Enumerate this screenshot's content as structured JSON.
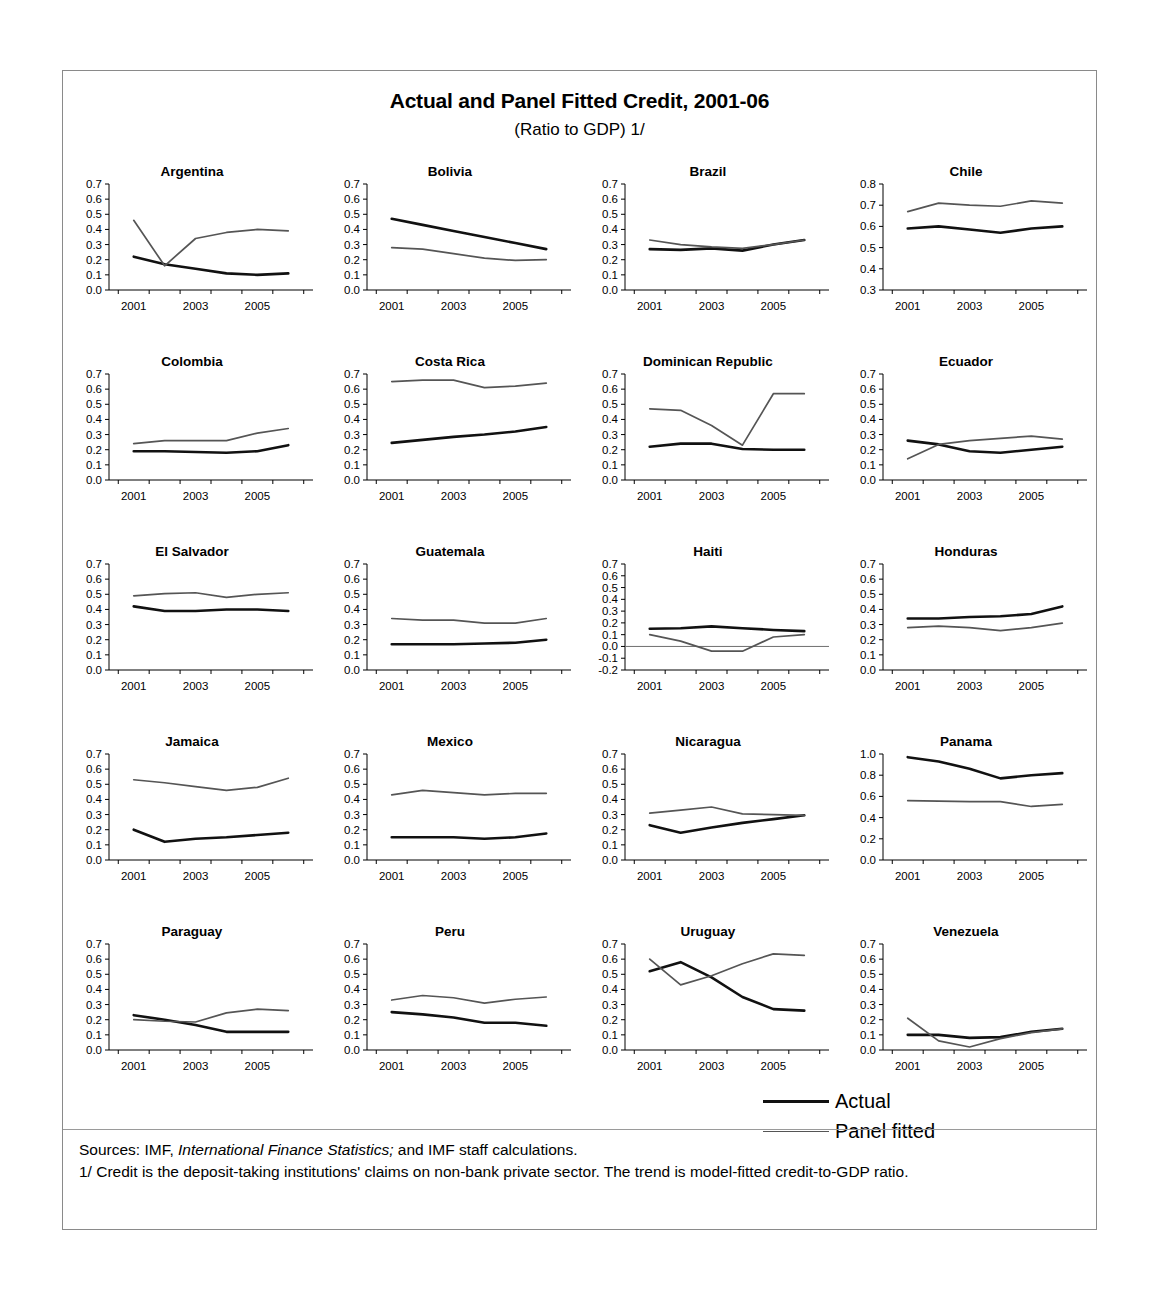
{
  "figure": {
    "title": "Actual and Panel Fitted Credit, 2001-06",
    "subtitle": "(Ratio to GDP) 1/",
    "legend": {
      "actual": "Actual",
      "fitted": "Panel fitted"
    },
    "notes": {
      "line1_a": "Sources: IMF, ",
      "line1_italic": "International Finance Statistics;",
      "line1_b": " and IMF staff calculations.",
      "line2": "1/ Credit is the deposit-taking institutions' claims on non-bank private sector. The trend is model-fitted credit-to-GDP ratio."
    }
  },
  "chart_data": {
    "type": "line",
    "title": "Actual and Panel Fitted Credit, 2001-06",
    "subtitle": "(Ratio to GDP) 1/",
    "xlabel": "",
    "ylabel": "Ratio to GDP",
    "x": [
      2001,
      2002,
      2003,
      2004,
      2005,
      2006
    ],
    "xtick_labels": [
      "2001",
      "2003",
      "2005"
    ],
    "grid": false,
    "legend_position": "bottom-right",
    "series_names": [
      "Actual",
      "Panel fitted"
    ],
    "panels": [
      {
        "name": "Argentina",
        "ylim": [
          0.0,
          0.7
        ],
        "yticks": [
          "0.0",
          "0.1",
          "0.2",
          "0.3",
          "0.4",
          "0.5",
          "0.6",
          "0.7"
        ],
        "series": [
          {
            "name": "Actual",
            "values": [
              0.22,
              0.17,
              0.14,
              0.11,
              0.1,
              0.11
            ]
          },
          {
            "name": "Panel fitted",
            "values": [
              0.46,
              0.16,
              0.34,
              0.38,
              0.4,
              0.39
            ]
          }
        ]
      },
      {
        "name": "Bolivia",
        "ylim": [
          0.0,
          0.7
        ],
        "yticks": [
          "0.0",
          "0.1",
          "0.2",
          "0.3",
          "0.4",
          "0.5",
          "0.6",
          "0.7"
        ],
        "series": [
          {
            "name": "Actual",
            "values": [
              0.47,
              0.43,
              0.39,
              0.35,
              0.31,
              0.27
            ]
          },
          {
            "name": "Panel fitted",
            "values": [
              0.28,
              0.27,
              0.24,
              0.21,
              0.195,
              0.2
            ]
          }
        ]
      },
      {
        "name": "Brazil",
        "ylim": [
          0.0,
          0.7
        ],
        "yticks": [
          "0.0",
          "0.1",
          "0.2",
          "0.3",
          "0.4",
          "0.5",
          "0.6",
          "0.7"
        ],
        "series": [
          {
            "name": "Actual",
            "values": [
              0.27,
              0.265,
              0.275,
              0.26,
              0.3,
              0.33
            ]
          },
          {
            "name": "Panel fitted",
            "values": [
              0.33,
              0.3,
              0.285,
              0.275,
              0.3,
              0.33
            ]
          }
        ]
      },
      {
        "name": "Chile",
        "ylim": [
          0.3,
          0.8
        ],
        "yticks": [
          "0.3",
          "0.4",
          "0.5",
          "0.6",
          "0.7",
          "0.8"
        ],
        "series": [
          {
            "name": "Actual",
            "values": [
              0.59,
              0.6,
              0.585,
              0.57,
              0.59,
              0.6
            ]
          },
          {
            "name": "Panel fitted",
            "values": [
              0.67,
              0.71,
              0.7,
              0.695,
              0.72,
              0.71
            ]
          }
        ]
      },
      {
        "name": "Colombia",
        "ylim": [
          0.0,
          0.7
        ],
        "yticks": [
          "0.0",
          "0.1",
          "0.2",
          "0.3",
          "0.4",
          "0.5",
          "0.6",
          "0.7"
        ],
        "series": [
          {
            "name": "Actual",
            "values": [
              0.19,
              0.19,
              0.185,
              0.18,
              0.19,
              0.23
            ]
          },
          {
            "name": "Panel fitted",
            "values": [
              0.24,
              0.26,
              0.26,
              0.26,
              0.31,
              0.34
            ]
          }
        ]
      },
      {
        "name": "Costa Rica",
        "ylim": [
          0.0,
          0.7
        ],
        "yticks": [
          "0.0",
          "0.1",
          "0.2",
          "0.3",
          "0.4",
          "0.5",
          "0.6",
          "0.7"
        ],
        "series": [
          {
            "name": "Actual",
            "values": [
              0.245,
              0.265,
              0.285,
              0.3,
              0.32,
              0.35
            ]
          },
          {
            "name": "Panel fitted",
            "values": [
              0.65,
              0.66,
              0.66,
              0.61,
              0.62,
              0.64
            ]
          }
        ]
      },
      {
        "name": "Dominican Republic",
        "ylim": [
          0.0,
          0.7
        ],
        "yticks": [
          "0.0",
          "0.1",
          "0.2",
          "0.3",
          "0.4",
          "0.5",
          "0.6",
          "0.7"
        ],
        "series": [
          {
            "name": "Actual",
            "values": [
              0.22,
              0.24,
              0.24,
              0.205,
              0.2,
              0.2
            ]
          },
          {
            "name": "Panel fitted",
            "values": [
              0.47,
              0.46,
              0.36,
              0.23,
              0.57,
              0.57
            ]
          }
        ]
      },
      {
        "name": "Ecuador",
        "ylim": [
          0.0,
          0.7
        ],
        "yticks": [
          "0.0",
          "0.1",
          "0.2",
          "0.3",
          "0.4",
          "0.5",
          "0.6",
          "0.7"
        ],
        "series": [
          {
            "name": "Actual",
            "values": [
              0.26,
              0.235,
              0.19,
              0.18,
              0.2,
              0.22
            ]
          },
          {
            "name": "Panel fitted",
            "values": [
              0.14,
              0.235,
              0.26,
              0.275,
              0.29,
              0.27
            ]
          }
        ]
      },
      {
        "name": "El Salvador",
        "ylim": [
          0.0,
          0.7
        ],
        "yticks": [
          "0.0",
          "0.1",
          "0.2",
          "0.3",
          "0.4",
          "0.5",
          "0.6",
          "0.7"
        ],
        "series": [
          {
            "name": "Actual",
            "values": [
              0.42,
              0.39,
              0.39,
              0.4,
              0.4,
              0.39
            ]
          },
          {
            "name": "Panel fitted",
            "values": [
              0.49,
              0.505,
              0.51,
              0.48,
              0.5,
              0.51
            ]
          }
        ]
      },
      {
        "name": "Guatemala",
        "ylim": [
          0.0,
          0.7
        ],
        "yticks": [
          "0.0",
          "0.1",
          "0.2",
          "0.3",
          "0.4",
          "0.5",
          "0.6",
          "0.7"
        ],
        "series": [
          {
            "name": "Actual",
            "values": [
              0.17,
              0.17,
              0.17,
              0.175,
              0.18,
              0.2
            ]
          },
          {
            "name": "Panel fitted",
            "values": [
              0.34,
              0.33,
              0.33,
              0.31,
              0.31,
              0.34
            ]
          }
        ]
      },
      {
        "name": "Haiti",
        "ylim": [
          -0.2,
          0.7
        ],
        "yticks": [
          "-0.2",
          "-0.1",
          "0.0",
          "0.1",
          "0.2",
          "0.3",
          "0.4",
          "0.5",
          "0.6",
          "0.7"
        ],
        "series": [
          {
            "name": "Actual",
            "values": [
              0.15,
              0.155,
              0.17,
              0.155,
              0.14,
              0.13
            ]
          },
          {
            "name": "Panel fitted",
            "values": [
              0.1,
              0.045,
              -0.04,
              -0.04,
              0.08,
              0.1
            ]
          }
        ]
      },
      {
        "name": "Honduras",
        "ylim": [
          0.0,
          0.7
        ],
        "yticks": [
          "0.0",
          "0.1",
          "0.2",
          "0.3",
          "0.4",
          "0.5",
          "0.6",
          "0.7"
        ],
        "series": [
          {
            "name": "Actual",
            "values": [
              0.34,
              0.34,
              0.35,
              0.355,
              0.37,
              0.42
            ]
          },
          {
            "name": "Panel fitted",
            "values": [
              0.28,
              0.29,
              0.28,
              0.26,
              0.28,
              0.31
            ]
          }
        ]
      },
      {
        "name": "Jamaica",
        "ylim": [
          0.0,
          0.7
        ],
        "yticks": [
          "0.0",
          "0.1",
          "0.2",
          "0.3",
          "0.4",
          "0.5",
          "0.6",
          "0.7"
        ],
        "series": [
          {
            "name": "Actual",
            "values": [
              0.2,
              0.12,
              0.14,
              0.15,
              0.165,
              0.18
            ]
          },
          {
            "name": "Panel fitted",
            "values": [
              0.53,
              0.51,
              0.485,
              0.46,
              0.48,
              0.54
            ]
          }
        ]
      },
      {
        "name": "Mexico",
        "ylim": [
          0.0,
          0.7
        ],
        "yticks": [
          "0.0",
          "0.1",
          "0.2",
          "0.3",
          "0.4",
          "0.5",
          "0.6",
          "0.7"
        ],
        "series": [
          {
            "name": "Actual",
            "values": [
              0.15,
              0.15,
              0.15,
              0.14,
              0.15,
              0.175
            ]
          },
          {
            "name": "Panel fitted",
            "values": [
              0.43,
              0.46,
              0.445,
              0.43,
              0.44,
              0.44
            ]
          }
        ]
      },
      {
        "name": "Nicaragua",
        "ylim": [
          0.0,
          0.7
        ],
        "yticks": [
          "0.0",
          "0.1",
          "0.2",
          "0.3",
          "0.4",
          "0.5",
          "0.6",
          "0.7"
        ],
        "series": [
          {
            "name": "Actual",
            "values": [
              0.23,
              0.18,
              0.215,
              0.245,
              0.27,
              0.295
            ]
          },
          {
            "name": "Panel fitted",
            "values": [
              0.31,
              0.33,
              0.35,
              0.305,
              0.3,
              0.295
            ]
          }
        ]
      },
      {
        "name": "Panama",
        "ylim": [
          0.0,
          1.0
        ],
        "yticks": [
          "0.0",
          "0.2",
          "0.4",
          "0.6",
          "0.8",
          "1.0"
        ],
        "series": [
          {
            "name": "Actual",
            "values": [
              0.97,
              0.93,
              0.86,
              0.77,
              0.8,
              0.82
            ]
          },
          {
            "name": "Panel fitted",
            "values": [
              0.56,
              0.555,
              0.55,
              0.55,
              0.505,
              0.525
            ]
          }
        ]
      },
      {
        "name": "Paraguay",
        "ylim": [
          0.0,
          0.7
        ],
        "yticks": [
          "0.0",
          "0.1",
          "0.2",
          "0.3",
          "0.4",
          "0.5",
          "0.6",
          "0.7"
        ],
        "series": [
          {
            "name": "Actual",
            "values": [
              0.23,
              0.2,
              0.165,
              0.12,
              0.12,
              0.12
            ]
          },
          {
            "name": "Panel fitted",
            "values": [
              0.2,
              0.19,
              0.185,
              0.245,
              0.27,
              0.26
            ]
          }
        ]
      },
      {
        "name": "Peru",
        "ylim": [
          0.0,
          0.7
        ],
        "yticks": [
          "0.0",
          "0.1",
          "0.2",
          "0.3",
          "0.4",
          "0.5",
          "0.6",
          "0.7"
        ],
        "series": [
          {
            "name": "Actual",
            "values": [
              0.25,
              0.235,
              0.215,
              0.18,
              0.18,
              0.16
            ]
          },
          {
            "name": "Panel fitted",
            "values": [
              0.33,
              0.36,
              0.345,
              0.31,
              0.335,
              0.35
            ]
          }
        ]
      },
      {
        "name": "Uruguay",
        "ylim": [
          0.0,
          0.7
        ],
        "yticks": [
          "0.0",
          "0.1",
          "0.2",
          "0.3",
          "0.4",
          "0.5",
          "0.6",
          "0.7"
        ],
        "series": [
          {
            "name": "Actual",
            "values": [
              0.52,
              0.58,
              0.48,
              0.35,
              0.27,
              0.26
            ]
          },
          {
            "name": "Panel fitted",
            "values": [
              0.6,
              0.43,
              0.49,
              0.57,
              0.635,
              0.625
            ]
          }
        ]
      },
      {
        "name": "Venezuela",
        "ylim": [
          0.0,
          0.7
        ],
        "yticks": [
          "0.0",
          "0.1",
          "0.2",
          "0.3",
          "0.4",
          "0.5",
          "0.6",
          "0.7"
        ],
        "series": [
          {
            "name": "Actual",
            "values": [
              0.1,
              0.1,
              0.08,
              0.085,
              0.12,
              0.14
            ]
          },
          {
            "name": "Panel fitted",
            "values": [
              0.21,
              0.06,
              0.02,
              0.075,
              0.115,
              0.14
            ]
          }
        ]
      }
    ]
  }
}
